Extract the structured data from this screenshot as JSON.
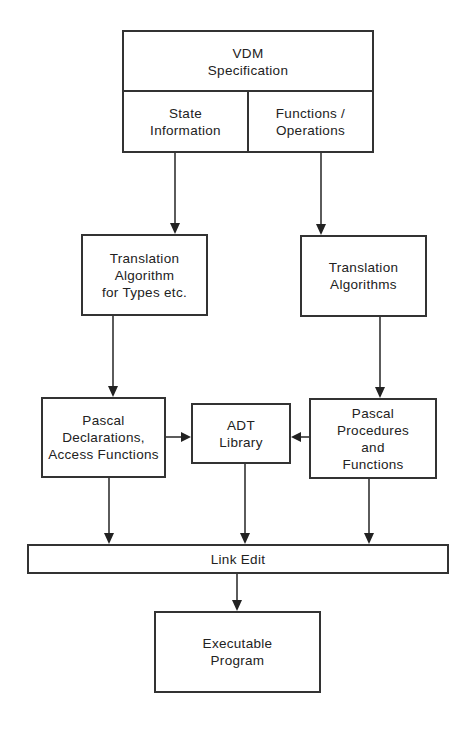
{
  "diagram": {
    "type": "flowchart",
    "nodes": {
      "vdm_spec": {
        "label": "VDM\nSpecification"
      },
      "state_info": {
        "label": "State\nInformation"
      },
      "functions_ops": {
        "label": "Functions /\nOperations"
      },
      "translation_types": {
        "label": "Translation\nAlgorithm\nfor Types etc."
      },
      "translation_algorithms": {
        "label": "Translation\nAlgorithms"
      },
      "pascal_declarations": {
        "label": "Pascal\nDeclarations,\nAccess Functions"
      },
      "adt_library": {
        "label": "ADT\nLibrary"
      },
      "pascal_procedures": {
        "label": "Pascal\nProcedures\nand\nFunctions"
      },
      "link_edit": {
        "label": "Link Edit"
      },
      "executable": {
        "label": "Executable\nProgram"
      }
    },
    "edges": [
      {
        "from": "state_info",
        "to": "translation_types"
      },
      {
        "from": "functions_ops",
        "to": "translation_algorithms"
      },
      {
        "from": "translation_types",
        "to": "pascal_declarations"
      },
      {
        "from": "translation_algorithms",
        "to": "pascal_procedures"
      },
      {
        "from": "pascal_declarations",
        "to": "adt_library"
      },
      {
        "from": "pascal_procedures",
        "to": "adt_library"
      },
      {
        "from": "pascal_declarations",
        "to": "link_edit"
      },
      {
        "from": "adt_library",
        "to": "link_edit"
      },
      {
        "from": "pascal_procedures",
        "to": "link_edit"
      },
      {
        "from": "link_edit",
        "to": "executable"
      }
    ]
  }
}
